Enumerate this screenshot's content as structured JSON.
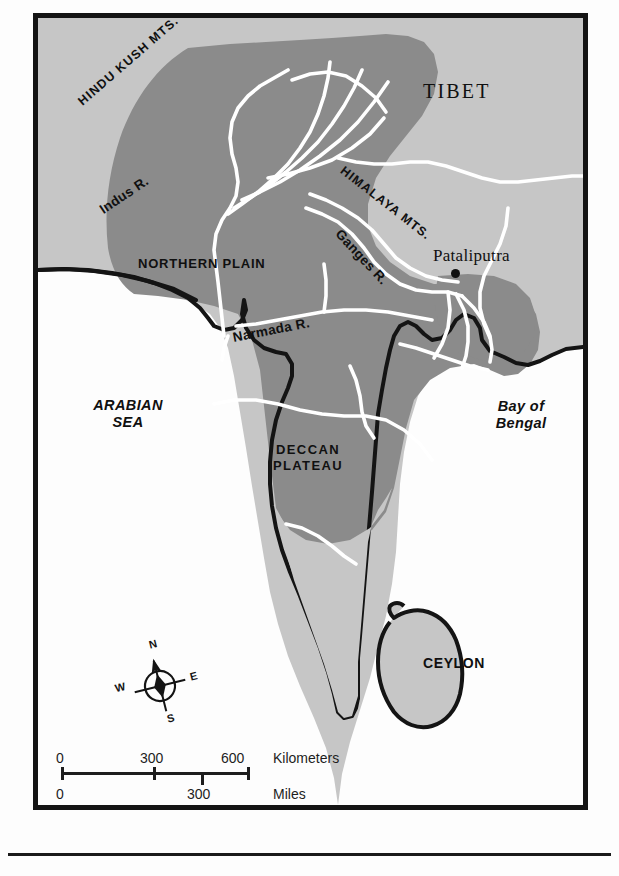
{
  "map": {
    "title": "Map of ancient India showing the Mauryan Empire",
    "colors": {
      "empire_fill": "#8b8b8b",
      "land_fill": "#c4c4c4",
      "sea_fill": "#fdfdfd",
      "river": "#ffffff",
      "coastline": "#141414",
      "frame": "#141414",
      "text": "#101010"
    },
    "regions": [
      {
        "id": "tibet",
        "label": "TIBET",
        "style": "serif-caps",
        "x": 418,
        "y": 80
      },
      {
        "id": "northern-plain",
        "label": "NORTHERN PLAIN",
        "style": "sans-caps",
        "x": 133,
        "y": 247
      },
      {
        "id": "deccan-plateau",
        "label": "DECCAN\nPLATEAU",
        "line1": "DECCAN",
        "line2": "PLATEAU",
        "style": "sans-caps",
        "x": 263,
        "y": 436
      },
      {
        "id": "ceylon",
        "label": "CEYLON",
        "style": "sans-caps",
        "x": 418,
        "y": 648
      }
    ],
    "water_bodies": [
      {
        "id": "arabian-sea",
        "line1": "ARABIAN",
        "line2": "SEA",
        "x": 75,
        "y": 392
      },
      {
        "id": "bay-of-bengal",
        "line1": "Bay of",
        "line2": "Bengal",
        "x": 478,
        "y": 393
      }
    ],
    "mountains": [
      {
        "id": "hindu-kush",
        "label": "HINDU KUSH MTS.",
        "x": 77,
        "y": 93,
        "rotate": -41
      },
      {
        "id": "himalaya",
        "label": "HIMALAYA MTS.",
        "x": 337,
        "y": 157,
        "rotate": 38
      }
    ],
    "rivers": [
      {
        "id": "indus",
        "label": "Indus R.",
        "x": 98,
        "y": 195,
        "rotate": -34
      },
      {
        "id": "ganges",
        "label": "Ganges R.",
        "x": 333,
        "y": 215,
        "rotate": 47
      },
      {
        "id": "narmada",
        "label": "Narmada R.",
        "x": 228,
        "y": 322,
        "rotate": -11
      }
    ],
    "cities": [
      {
        "id": "pataliputra",
        "label": "Pataliputra",
        "label_x": 428,
        "label_y": 240,
        "dot_x": 446,
        "dot_y": 264
      }
    ]
  },
  "compass": {
    "north": "N",
    "east": "E",
    "south": "S",
    "west": "W"
  },
  "scale_bar": {
    "kilometers": {
      "unit_label": "Kilometers",
      "ticks": [
        "0",
        "300",
        "600"
      ]
    },
    "miles": {
      "unit_label": "Miles",
      "ticks": [
        "0",
        "300"
      ]
    }
  }
}
